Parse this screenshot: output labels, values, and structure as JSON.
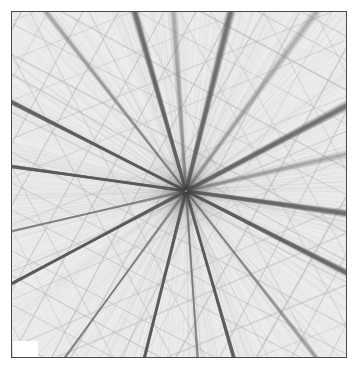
{
  "figure": {
    "title": "",
    "background_color": "#ffffff",
    "frame_color": "#4a4a4a",
    "plot_background_color": "#f2f2f2",
    "width_px": 357,
    "height_px": 370,
    "plot_left_px": 11,
    "plot_top_px": 11,
    "plot_width_px": 336,
    "plot_height_px": 347
  },
  "overlay": {
    "white_patch": {
      "name": "white-occlusion-patch",
      "color": "#ffffff",
      "left_px": 13,
      "top_px": 341,
      "width_px": 25,
      "height_px": 16
    }
  },
  "chart_data": {
    "type": "line",
    "title": "",
    "subtitle": "",
    "xlabel": "",
    "ylabel": "",
    "xlim": [
      0,
      336
    ],
    "ylim": [
      0,
      347
    ],
    "grid": false,
    "legend": null,
    "annotations": [],
    "tick_labels": {
      "x": [],
      "y": []
    },
    "convergence_point": {
      "x": 174,
      "y": 179
    },
    "line_color": "#707070",
    "faint_line_color": "#b9b9b9",
    "strong_line_color": "#555555",
    "base_texture_color": "#ececec",
    "radial_families": [
      {
        "name": "radial-1",
        "angle_deg": 8,
        "weight": "strong"
      },
      {
        "name": "radial-2",
        "angle_deg": 27,
        "weight": "strong"
      },
      {
        "name": "radial-3",
        "angle_deg": 52,
        "weight": "medium"
      },
      {
        "name": "radial-4",
        "angle_deg": 74,
        "weight": "strong"
      },
      {
        "name": "radial-5",
        "angle_deg": 86,
        "weight": "medium"
      },
      {
        "name": "radial-6",
        "angle_deg": 104,
        "weight": "strong"
      },
      {
        "name": "radial-7",
        "angle_deg": 126,
        "weight": "medium"
      },
      {
        "name": "radial-8",
        "angle_deg": 152,
        "weight": "strong"
      },
      {
        "name": "radial-9",
        "angle_deg": 167,
        "weight": "medium"
      }
    ],
    "hatch_families": [
      {
        "name": "hatch-a",
        "angle_deg": 28,
        "spacing_px": 29,
        "color": "#a8a8a8"
      },
      {
        "name": "hatch-b",
        "angle_deg": 118,
        "spacing_px": 31,
        "color": "#a8a8a8"
      },
      {
        "name": "hatch-c",
        "angle_deg": 62,
        "spacing_px": 41,
        "color": "#bcbcbc"
      },
      {
        "name": "hatch-d",
        "angle_deg": 158,
        "spacing_px": 37,
        "color": "#bcbcbc"
      }
    ],
    "micro_texture": {
      "count": 900,
      "color": "#cfcfcf",
      "description": "very fine short strokes giving the woven/fibrous appearance"
    }
  }
}
